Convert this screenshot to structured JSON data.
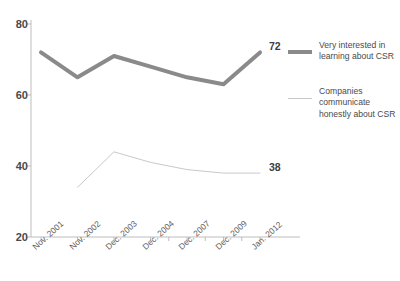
{
  "title": "",
  "chart_data": {
    "type": "line",
    "title": "",
    "subtitle": "",
    "xlabel": "",
    "ylabel": "",
    "ylim": [
      20,
      80
    ],
    "yticks": [
      80,
      60,
      40,
      20
    ],
    "grid": false,
    "legend_position": "right",
    "categories": [
      "Nov. 2001",
      "Nov. 2002",
      "Dec. 2003",
      "Dec. 2004",
      "Dec. 2007",
      "Dec. 2009",
      "Jan. 2012"
    ],
    "series": [
      {
        "name": "Very interested in learning about CSR",
        "color": "#8a8a8a",
        "width": 4,
        "values": [
          72,
          65,
          71,
          68,
          65,
          63,
          72
        ],
        "end_label": "72"
      },
      {
        "name": "Companies communicate honestly about CSR",
        "color": "#c9c9c9",
        "width": 1,
        "values": [
          null,
          34,
          44,
          41,
          39,
          38,
          38
        ],
        "end_label": "38"
      }
    ],
    "annotations": [
      {
        "text": "72",
        "series": "Very interested in learning about CSR",
        "at": "Jan. 2012"
      },
      {
        "text": "38",
        "series": "Companies communicate honestly about CSR",
        "at": "Jan. 2012"
      }
    ]
  },
  "legend": {
    "items": [
      {
        "label": "Very interested in learning about CSR",
        "style": "thick",
        "color": "#8a8a8a"
      },
      {
        "label": "Companies communicate honestly about CSR",
        "style": "thin",
        "color": "#c9c9c9"
      }
    ]
  },
  "axis": {
    "axis_color": "#bdbdbd",
    "tick_color": "#bdbdbd",
    "label_color": "#5d5d5d"
  }
}
